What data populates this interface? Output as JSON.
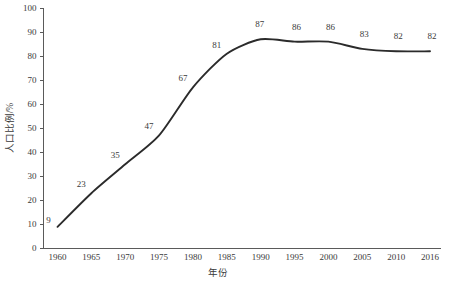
{
  "chart_data": {
    "type": "line",
    "title": "",
    "xlabel": "年份",
    "ylabel": "人口比例/%",
    "categories": [
      "1960",
      "1965",
      "1970",
      "1975",
      "1980",
      "1985",
      "1990",
      "1995",
      "2000",
      "2005",
      "2010",
      "2016"
    ],
    "values": [
      9,
      23,
      35,
      47,
      67,
      81,
      87,
      86,
      86,
      83,
      82,
      82
    ],
    "point_labels": [
      "9",
      "23",
      "35",
      "47",
      "67",
      "81",
      "87",
      "86",
      "86",
      "83",
      "82",
      "82"
    ],
    "ylim": [
      0,
      100
    ],
    "ytick_labels": [
      "0",
      "10",
      "20",
      "30",
      "40",
      "50",
      "60",
      "70",
      "80",
      "90",
      "100"
    ],
    "ytick_values": [
      0,
      10,
      20,
      30,
      40,
      50,
      60,
      70,
      80,
      90,
      100
    ],
    "grid": false,
    "legend": "none",
    "series_color": "#2b2b2b",
    "axis_color": "#5a5a5a",
    "text_color": "#3a3a3a",
    "background": "#ffffff"
  }
}
